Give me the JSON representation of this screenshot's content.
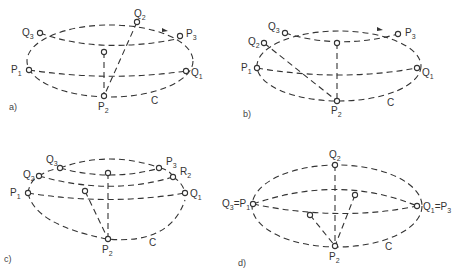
{
  "panels": [
    {
      "id": "a",
      "caption": "a)",
      "curve_label": "C",
      "points": {
        "Q3": "Q",
        "Q3s": "3",
        "Q2": "Q",
        "Q2s": "2",
        "P3": "P",
        "P3s": "3",
        "P1": "P",
        "P1s": "1",
        "Q1": "Q",
        "Q1s": "1",
        "P2": "P",
        "P2s": "2"
      }
    },
    {
      "id": "b",
      "caption": "b)",
      "curve_label": "C",
      "points": {
        "Q3": "Q",
        "Q3s": "3",
        "Q2": "Q",
        "Q2s": "2",
        "P3": "P",
        "P3s": "3",
        "P1": "P",
        "P1s": "1",
        "Q1": "Q",
        "Q1s": "1",
        "P2": "P",
        "P2s": "2"
      }
    },
    {
      "id": "c",
      "caption": "c)",
      "curve_label": "C",
      "points": {
        "Q3": "Q",
        "Q3s": "3",
        "Q2": "Q",
        "Q2s": "2",
        "P3": "P",
        "P3s": "3",
        "R2": "R",
        "R2s": "2",
        "P1": "P",
        "P1s": "1",
        "Q1": "Q",
        "Q1s": "1",
        "P2": "P",
        "P2s": "2"
      }
    },
    {
      "id": "d",
      "caption": "d)",
      "curve_label": "C",
      "points": {
        "Q2": "Q",
        "Q2s": "2",
        "left": "Q",
        "left_s1": "3",
        "left_eq": "=P",
        "left_s2": "1",
        "right": "Q",
        "right_s1": "1",
        "right_eq": "=P",
        "right_s2": "3",
        "P2": "P",
        "P2s": "2"
      }
    }
  ]
}
